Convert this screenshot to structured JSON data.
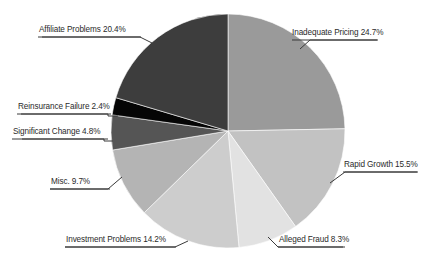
{
  "chart_data": {
    "type": "pie",
    "title": "",
    "subtitle": "",
    "xlabel": "",
    "ylabel": "",
    "legend_position": "none",
    "grid": false,
    "units": "percent",
    "start_angle_deg": 0,
    "direction": "clockwise",
    "categories": [
      "Inadequate Pricing",
      "Rapid Growth",
      "Alleged Fraud",
      "Investment Problems",
      "Misc.",
      "Significant Change",
      "Reinsurance Failure",
      "Affiliate Problems"
    ],
    "values": [
      24.7,
      15.5,
      8.3,
      14.2,
      9.7,
      4.8,
      2.4,
      20.4
    ],
    "colors": [
      "#9a9a9a",
      "#c2c2c2",
      "#e2e2e2",
      "#cdcdcd",
      "#b4b4b4",
      "#555555",
      "#050505",
      "#3d3d3d"
    ],
    "slices": [
      {
        "label": "Inadequate Pricing",
        "value": 24.7,
        "value_text": "24.7%",
        "color": "#9a9a9a"
      },
      {
        "label": "Rapid Growth",
        "value": 15.5,
        "value_text": "15.5%",
        "color": "#c2c2c2"
      },
      {
        "label": "Alleged Fraud",
        "value": 8.3,
        "value_text": "8.3%",
        "color": "#e2e2e2"
      },
      {
        "label": "Investment Problems",
        "value": 14.2,
        "value_text": "14.2%",
        "color": "#cdcdcd"
      },
      {
        "label": "Misc.",
        "value": 9.7,
        "value_text": "9.7%",
        "color": "#b4b4b4"
      },
      {
        "label": "Significant Change",
        "value": 4.8,
        "value_text": "4.8%",
        "color": "#555555"
      },
      {
        "label": "Reinsurance Failure",
        "value": 2.4,
        "value_text": "2.4%",
        "color": "#050505"
      },
      {
        "label": "Affiliate Problems",
        "value": 20.4,
        "value_text": "20.4%",
        "color": "#3d3d3d"
      }
    ]
  },
  "labels": {
    "inadequate_pricing": "Inadequate Pricing 24.7%",
    "rapid_growth": "Rapid Growth 15.5%",
    "alleged_fraud": "Alleged Fraud 8.3%",
    "investment_problems": "Investment Problems 14.2%",
    "misc": "Misc. 9.7%",
    "significant_change": "Significant Change 4.8%",
    "reinsurance_failure": "Reinsurance Failure 2.4%",
    "affiliate_problems": "Affiliate Problems 20.4%"
  },
  "geometry": {
    "center_x": 228,
    "center_y": 131,
    "radius": 117
  }
}
